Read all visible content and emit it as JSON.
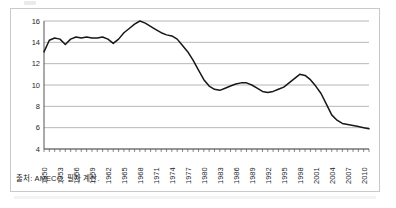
{
  "figure": {
    "source_note": "출처: AMECO. 필자 계산.",
    "axis_color": "#555555",
    "grid_color": "#9a9a9a",
    "line_color": "#171717",
    "frame_color": "#c9c9c9"
  },
  "chart_data": {
    "type": "line",
    "title": "",
    "subtitle": "",
    "xlabel": "",
    "ylabel": "",
    "grid": true,
    "legend": false,
    "legend_position": "none",
    "xlim": [
      1950,
      2011
    ],
    "ylim": [
      4,
      16
    ],
    "yticks": [
      4,
      6,
      8,
      10,
      12,
      14,
      16
    ],
    "ytick_labels": [
      "4",
      "6",
      "8",
      "10",
      "12",
      "14",
      "16"
    ],
    "xticks": [
      1950,
      1953,
      1956,
      1959,
      1962,
      1965,
      1968,
      1971,
      1974,
      1977,
      1980,
      1983,
      1986,
      1989,
      1992,
      1995,
      1998,
      2001,
      2004,
      2007,
      2010
    ],
    "xtick_labels": [
      "1950",
      "1953",
      "1956",
      "1959",
      "1962",
      "1965",
      "1968",
      "1971",
      "1974",
      "1977",
      "1980",
      "1983",
      "1986",
      "1989",
      "1992",
      "1995",
      "1998",
      "2001",
      "2004",
      "2007",
      "2010"
    ],
    "x": [
      1950,
      1951,
      1952,
      1953,
      1954,
      1955,
      1956,
      1957,
      1958,
      1959,
      1960,
      1961,
      1962,
      1963,
      1964,
      1965,
      1966,
      1967,
      1968,
      1969,
      1970,
      1971,
      1972,
      1973,
      1974,
      1975,
      1976,
      1977,
      1978,
      1979,
      1980,
      1981,
      1982,
      1983,
      1984,
      1985,
      1986,
      1987,
      1988,
      1989,
      1990,
      1991,
      1992,
      1993,
      1994,
      1995,
      1996,
      1997,
      1998,
      1999,
      2000,
      2001,
      2002,
      2003,
      2004,
      2005,
      2006,
      2007,
      2008,
      2009,
      2010,
      2011
    ],
    "series": [
      {
        "name": "",
        "values": [
          13.1,
          14.2,
          14.4,
          14.3,
          13.8,
          14.3,
          14.5,
          14.4,
          14.5,
          14.4,
          14.4,
          14.5,
          14.3,
          13.9,
          14.3,
          14.9,
          15.3,
          15.7,
          16.0,
          15.8,
          15.5,
          15.2,
          14.9,
          14.7,
          14.6,
          14.3,
          13.7,
          13.1,
          12.3,
          11.4,
          10.5,
          9.9,
          9.6,
          9.5,
          9.7,
          9.9,
          10.1,
          10.2,
          10.2,
          10.0,
          9.7,
          9.4,
          9.3,
          9.4,
          9.6,
          9.8,
          10.2,
          10.6,
          11.0,
          10.9,
          10.5,
          9.9,
          9.2,
          8.2,
          7.2,
          6.7,
          6.4,
          6.3,
          6.2,
          6.1,
          6.0,
          5.9
        ]
      }
    ]
  }
}
